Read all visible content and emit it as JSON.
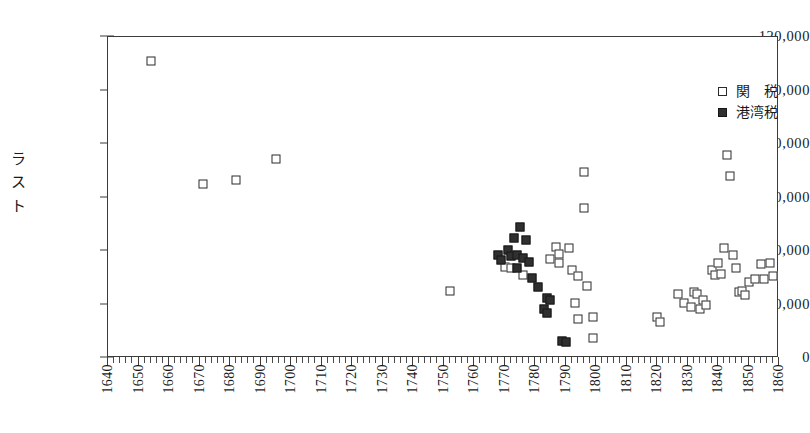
{
  "chart_data": {
    "type": "scatter",
    "title": "",
    "xlabel": "",
    "ylabel": "ラスト",
    "xlim": [
      1640,
      1860
    ],
    "ylim": [
      0,
      120000
    ],
    "grid": false,
    "legend_position": "top-right",
    "x_ticks": [
      1640,
      1650,
      1660,
      1670,
      1680,
      1690,
      1700,
      1710,
      1720,
      1730,
      1740,
      1750,
      1760,
      1770,
      1780,
      1790,
      1800,
      1810,
      1820,
      1830,
      1840,
      1850,
      1860
    ],
    "x_minor_tick_step": 2,
    "y_ticks": [
      0,
      20000,
      40000,
      60000,
      80000,
      100000,
      120000
    ],
    "y_tick_labels": [
      "0",
      "20,000",
      "40,000",
      "60,000",
      "80,000",
      "100,000",
      "120,000"
    ],
    "series": [
      {
        "name": "関　税",
        "marker": "open-square",
        "color": "#2a2a2a",
        "points": [
          [
            1654,
            111000
          ],
          [
            1671,
            65000
          ],
          [
            1682,
            66500
          ],
          [
            1695,
            74500
          ],
          [
            1752,
            25000
          ],
          [
            1770,
            34000
          ],
          [
            1772,
            33500
          ],
          [
            1776,
            31000
          ],
          [
            1785,
            37000
          ],
          [
            1787,
            41500
          ],
          [
            1788,
            39000
          ],
          [
            1788,
            35500
          ],
          [
            1791,
            41000
          ],
          [
            1792,
            33000
          ],
          [
            1793,
            20500
          ],
          [
            1794,
            30500
          ],
          [
            1794,
            14500
          ],
          [
            1796,
            69500
          ],
          [
            1796,
            56000
          ],
          [
            1797,
            27000
          ],
          [
            1799,
            15500
          ],
          [
            1799,
            7500
          ],
          [
            1820,
            15500
          ],
          [
            1821,
            13500
          ],
          [
            1827,
            24000
          ],
          [
            1829,
            20500
          ],
          [
            1831,
            19000
          ],
          [
            1832,
            24500
          ],
          [
            1833,
            24000
          ],
          [
            1834,
            18500
          ],
          [
            1835,
            21500
          ],
          [
            1836,
            20000
          ],
          [
            1838,
            33000
          ],
          [
            1839,
            31000
          ],
          [
            1840,
            35500
          ],
          [
            1841,
            31500
          ],
          [
            1842,
            41000
          ],
          [
            1843,
            76000
          ],
          [
            1844,
            68000
          ],
          [
            1845,
            38500
          ],
          [
            1846,
            33500
          ],
          [
            1847,
            24500
          ],
          [
            1848,
            25000
          ],
          [
            1849,
            23500
          ],
          [
            1850,
            28500
          ],
          [
            1852,
            29500
          ],
          [
            1854,
            35000
          ],
          [
            1855,
            29500
          ],
          [
            1857,
            35500
          ],
          [
            1858,
            30500
          ]
        ]
      },
      {
        "name": "港湾税",
        "marker": "filled-square",
        "color": "#303030",
        "points": [
          [
            1768,
            38500
          ],
          [
            1769,
            36500
          ],
          [
            1771,
            40500
          ],
          [
            1772,
            38000
          ],
          [
            1773,
            45000
          ],
          [
            1774,
            38500
          ],
          [
            1774,
            33500
          ],
          [
            1775,
            49000
          ],
          [
            1776,
            37500
          ],
          [
            1777,
            44000
          ],
          [
            1778,
            36000
          ],
          [
            1779,
            30000
          ],
          [
            1781,
            26500
          ],
          [
            1783,
            18500
          ],
          [
            1784,
            22500
          ],
          [
            1784,
            17000
          ],
          [
            1785,
            21500
          ],
          [
            1789,
            6500
          ],
          [
            1790,
            6000
          ]
        ]
      }
    ]
  },
  "legend": {
    "items": [
      {
        "label": "関　税",
        "marker": "open"
      },
      {
        "label": "港湾税",
        "marker": "filled"
      }
    ]
  }
}
